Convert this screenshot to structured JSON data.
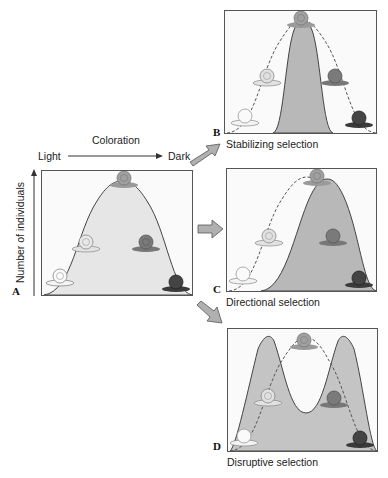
{
  "figure": {
    "panel_a": {
      "letter": "A",
      "x_axis": {
        "label": "Coloration",
        "left_end": "Light",
        "right_end": "Dark"
      },
      "y_axis": {
        "label": "Number of individuals"
      },
      "description": "Original bell-shaped distribution of snail coloration"
    },
    "panel_b": {
      "letter": "B",
      "caption": "Stabilizing selection"
    },
    "panel_c": {
      "letter": "C",
      "caption": "Directional selection"
    },
    "panel_d": {
      "letter": "D",
      "caption": "Disruptive selection"
    },
    "snails": [
      "white",
      "light",
      "medium",
      "dark-medium",
      "dark"
    ],
    "colors": {
      "original_fill": "#e6e6e6",
      "selected_fill": "#b8b8b8",
      "arrow_fill": "#b0b0b0",
      "border": "#555555",
      "snail_dark": "#3a3a3a"
    }
  }
}
